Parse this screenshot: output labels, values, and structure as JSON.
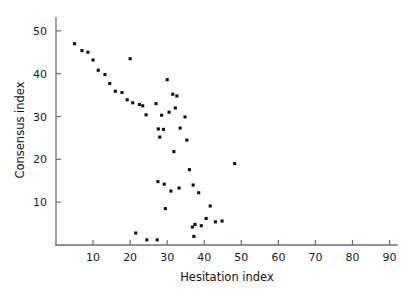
{
  "chart_data": {
    "type": "scatter",
    "title": "",
    "xlabel": "Hesitation index",
    "ylabel": "Consensus index",
    "xlim": [
      0,
      92
    ],
    "ylim": [
      0,
      53
    ],
    "xticks": [
      10,
      20,
      30,
      40,
      50,
      60,
      70,
      80,
      90
    ],
    "xtick_labels": [
      "10",
      "20",
      "30",
      "40",
      "50",
      "60",
      "70",
      "80",
      "90"
    ],
    "yticks": [
      10,
      20,
      30,
      40,
      50
    ],
    "ytick_labels": [
      "10",
      "20",
      "30",
      "40",
      "50"
    ],
    "grid": false,
    "legend": null,
    "marker": "square",
    "marker_color": "#111111",
    "series": [
      {
        "name": "observations",
        "points": [
          [
            5.0,
            47.0
          ],
          [
            7.0,
            45.4
          ],
          [
            8.6,
            45.0
          ],
          [
            10.0,
            43.2
          ],
          [
            11.4,
            40.8
          ],
          [
            13.2,
            39.8
          ],
          [
            14.5,
            37.7
          ],
          [
            16.0,
            35.9
          ],
          [
            17.8,
            35.6
          ],
          [
            19.2,
            33.9
          ],
          [
            20.0,
            43.5
          ],
          [
            20.7,
            33.2
          ],
          [
            22.5,
            32.8
          ],
          [
            23.4,
            32.5
          ],
          [
            24.3,
            30.4
          ],
          [
            21.5,
            2.8
          ],
          [
            24.5,
            1.2
          ],
          [
            27.3,
            1.2
          ],
          [
            27.0,
            33.0
          ],
          [
            28.5,
            30.3
          ],
          [
            27.6,
            27.1
          ],
          [
            29.0,
            27.0
          ],
          [
            28.0,
            25.2
          ],
          [
            30.0,
            38.6
          ],
          [
            31.5,
            35.2
          ],
          [
            32.6,
            34.8
          ],
          [
            30.5,
            31.0
          ],
          [
            32.2,
            32.0
          ],
          [
            34.8,
            29.9
          ],
          [
            33.5,
            27.3
          ],
          [
            35.3,
            24.5
          ],
          [
            31.8,
            21.8
          ],
          [
            36.0,
            17.6
          ],
          [
            27.5,
            14.8
          ],
          [
            29.2,
            14.2
          ],
          [
            33.2,
            13.3
          ],
          [
            37.0,
            14.0
          ],
          [
            31.0,
            12.6
          ],
          [
            38.5,
            12.2
          ],
          [
            29.5,
            8.5
          ],
          [
            37.5,
            4.8
          ],
          [
            39.2,
            4.5
          ],
          [
            36.8,
            4.2
          ],
          [
            37.2,
            2.0
          ],
          [
            40.5,
            6.2
          ],
          [
            43.0,
            5.4
          ],
          [
            44.8,
            5.6
          ],
          [
            41.6,
            9.1
          ],
          [
            48.2,
            19.0
          ]
        ]
      }
    ]
  },
  "axes": {
    "x_axis_name": "x-axis",
    "y_axis_name": "y-axis"
  }
}
